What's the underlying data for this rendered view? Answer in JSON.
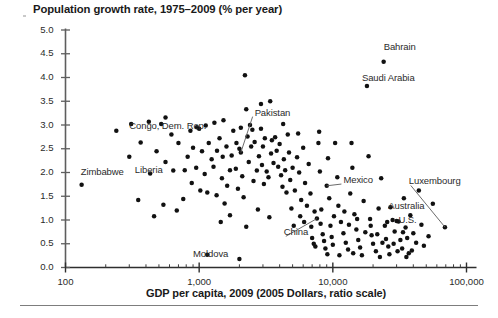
{
  "chart_data": {
    "type": "scatter",
    "title": "Population growth rate, 1975–2009 (% per year)",
    "xlabel": "GDP per capita, 2009 (2005 Dollars, ratio scale)",
    "ylabel": "",
    "xscale": "log",
    "yscale": "linear",
    "xlim": [
      100,
      100000
    ],
    "ylim": [
      0.0,
      5.0
    ],
    "grid": false,
    "legend": "none",
    "xtick_labels": [
      "100",
      "1,000",
      "10,000",
      "100,000"
    ],
    "xtick_values": [
      100,
      1000,
      10000,
      100000
    ],
    "ytick_labels": [
      "0.0",
      "0.5",
      "1.0",
      "1.5",
      "2.0",
      "2.5",
      "3.0",
      "3.5",
      "4.0",
      "4.5",
      "5.0"
    ],
    "ytick_values": [
      0.0,
      0.5,
      1.0,
      1.5,
      2.0,
      2.5,
      3.0,
      3.5,
      4.0,
      4.5,
      5.0
    ],
    "annotations": [
      {
        "text": "Congo, Dem. Rep.",
        "x": 300,
        "y": 2.95,
        "align": "left",
        "leader": false
      },
      {
        "text": "Liberia",
        "x": 330,
        "y": 2.03,
        "align": "left",
        "leader": false
      },
      {
        "text": "Zimbabwe",
        "x": 130,
        "y": 2.0,
        "align": "left",
        "leader": false
      },
      {
        "text": "Pakistan",
        "x": 2600,
        "y": 3.24,
        "align": "left",
        "leader": true,
        "leader_to_x": 2050,
        "leader_to_y": 2.42
      },
      {
        "text": "Bahrain",
        "x": 24000,
        "y": 4.63,
        "align": "left",
        "leader": false
      },
      {
        "text": "Saudi Arabia",
        "x": 16500,
        "y": 3.96,
        "align": "left",
        "leader": false
      },
      {
        "text": "Mexico",
        "x": 12000,
        "y": 1.82,
        "align": "left",
        "leader": true,
        "leader_to_x": 9000,
        "leader_to_y": 1.72
      },
      {
        "text": "Luxembourg",
        "x": 37000,
        "y": 1.79,
        "align": "left",
        "leader": true,
        "leader_to_x": 69000,
        "leader_to_y": 0.85
      },
      {
        "text": "Australia",
        "x": 26000,
        "y": 1.27,
        "align": "left",
        "leader": false
      },
      {
        "text": "U.S.",
        "x": 31000,
        "y": 0.97,
        "align": "left",
        "leader": false
      },
      {
        "text": "China",
        "x": 4300,
        "y": 0.72,
        "align": "left",
        "leader": true,
        "leader_to_x": 7600,
        "leader_to_y": 1.03
      },
      {
        "text": "Moldova",
        "x": 900,
        "y": 0.27,
        "align": "left",
        "leader": false
      }
    ],
    "points": [
      {
        "x": 132,
        "y": 1.74
      },
      {
        "x": 310,
        "y": 3.02
      },
      {
        "x": 240,
        "y": 2.88
      },
      {
        "x": 420,
        "y": 3.07
      },
      {
        "x": 520,
        "y": 3.02
      },
      {
        "x": 365,
        "y": 2.63
      },
      {
        "x": 300,
        "y": 2.33
      },
      {
        "x": 480,
        "y": 2.45
      },
      {
        "x": 620,
        "y": 2.8
      },
      {
        "x": 700,
        "y": 2.62
      },
      {
        "x": 560,
        "y": 2.22
      },
      {
        "x": 640,
        "y": 2.04
      },
      {
        "x": 430,
        "y": 1.98
      },
      {
        "x": 780,
        "y": 2.05
      },
      {
        "x": 350,
        "y": 1.42
      },
      {
        "x": 540,
        "y": 1.32
      },
      {
        "x": 860,
        "y": 2.88
      },
      {
        "x": 960,
        "y": 2.95
      },
      {
        "x": 1000,
        "y": 2.92
      },
      {
        "x": 1120,
        "y": 2.99
      },
      {
        "x": 900,
        "y": 2.52
      },
      {
        "x": 1050,
        "y": 2.45
      },
      {
        "x": 820,
        "y": 2.33
      },
      {
        "x": 1180,
        "y": 2.62
      },
      {
        "x": 1240,
        "y": 2.28
      },
      {
        "x": 950,
        "y": 2.1
      },
      {
        "x": 1100,
        "y": 1.97
      },
      {
        "x": 880,
        "y": 1.78
      },
      {
        "x": 1020,
        "y": 1.62
      },
      {
        "x": 1150,
        "y": 1.58
      },
      {
        "x": 760,
        "y": 1.44
      },
      {
        "x": 1300,
        "y": 3.05
      },
      {
        "x": 1420,
        "y": 2.72
      },
      {
        "x": 1360,
        "y": 2.46
      },
      {
        "x": 1500,
        "y": 2.33
      },
      {
        "x": 1280,
        "y": 2.12
      },
      {
        "x": 1600,
        "y": 2.55
      },
      {
        "x": 1480,
        "y": 1.88
      },
      {
        "x": 1620,
        "y": 1.72
      },
      {
        "x": 1350,
        "y": 1.52
      },
      {
        "x": 1550,
        "y": 1.35
      },
      {
        "x": 1700,
        "y": 2.05
      },
      {
        "x": 1800,
        "y": 2.88
      },
      {
        "x": 1900,
        "y": 2.62
      },
      {
        "x": 1750,
        "y": 2.36
      },
      {
        "x": 2000,
        "y": 2.5
      },
      {
        "x": 2050,
        "y": 2.42
      },
      {
        "x": 1880,
        "y": 2.08
      },
      {
        "x": 2100,
        "y": 1.92
      },
      {
        "x": 2200,
        "y": 4.05
      },
      {
        "x": 2250,
        "y": 3.33
      },
      {
        "x": 1950,
        "y": 1.66
      },
      {
        "x": 2150,
        "y": 1.48
      },
      {
        "x": 2300,
        "y": 2.76
      },
      {
        "x": 2400,
        "y": 3.0
      },
      {
        "x": 2500,
        "y": 2.9
      },
      {
        "x": 2450,
        "y": 2.55
      },
      {
        "x": 2600,
        "y": 2.64
      },
      {
        "x": 2350,
        "y": 2.22
      },
      {
        "x": 2700,
        "y": 2.04
      },
      {
        "x": 2550,
        "y": 1.82
      },
      {
        "x": 2800,
        "y": 2.34
      },
      {
        "x": 2900,
        "y": 2.92
      },
      {
        "x": 3000,
        "y": 2.55
      },
      {
        "x": 3100,
        "y": 2.72
      },
      {
        "x": 2950,
        "y": 2.16
      },
      {
        "x": 3200,
        "y": 2.02
      },
      {
        "x": 3050,
        "y": 1.76
      },
      {
        "x": 3300,
        "y": 1.9
      },
      {
        "x": 3400,
        "y": 3.5
      },
      {
        "x": 3500,
        "y": 2.68
      },
      {
        "x": 3450,
        "y": 2.4
      },
      {
        "x": 3600,
        "y": 2.2
      },
      {
        "x": 3700,
        "y": 2.74
      },
      {
        "x": 3800,
        "y": 2.46
      },
      {
        "x": 3900,
        "y": 2.12
      },
      {
        "x": 4000,
        "y": 2.6
      },
      {
        "x": 4100,
        "y": 1.94
      },
      {
        "x": 4200,
        "y": 1.7
      },
      {
        "x": 4300,
        "y": 2.28
      },
      {
        "x": 4400,
        "y": 2.05
      },
      {
        "x": 4500,
        "y": 1.58
      },
      {
        "x": 4600,
        "y": 2.8
      },
      {
        "x": 4700,
        "y": 2.42
      },
      {
        "x": 4800,
        "y": 1.84
      },
      {
        "x": 5000,
        "y": 2.1
      },
      {
        "x": 5200,
        "y": 1.62
      },
      {
        "x": 5400,
        "y": 2.32
      },
      {
        "x": 5600,
        "y": 2.0
      },
      {
        "x": 5800,
        "y": 1.42
      },
      {
        "x": 6000,
        "y": 2.52
      },
      {
        "x": 6200,
        "y": 1.78
      },
      {
        "x": 6400,
        "y": 1.3
      },
      {
        "x": 6600,
        "y": 2.18
      },
      {
        "x": 6800,
        "y": 1.56
      },
      {
        "x": 7000,
        "y": 0.62
      },
      {
        "x": 7200,
        "y": 0.5
      },
      {
        "x": 7400,
        "y": 0.44
      },
      {
        "x": 7600,
        "y": 1.03
      },
      {
        "x": 7800,
        "y": 2.62
      },
      {
        "x": 8000,
        "y": 2.02
      },
      {
        "x": 8200,
        "y": 1.22
      },
      {
        "x": 8400,
        "y": 0.7
      },
      {
        "x": 8600,
        "y": 0.56
      },
      {
        "x": 8800,
        "y": 0.4
      },
      {
        "x": 9000,
        "y": 1.72
      },
      {
        "x": 9200,
        "y": 2.3
      },
      {
        "x": 9400,
        "y": 1.46
      },
      {
        "x": 9600,
        "y": 0.88
      },
      {
        "x": 9800,
        "y": 0.64
      },
      {
        "x": 10000,
        "y": 0.48
      },
      {
        "x": 10400,
        "y": 2.62
      },
      {
        "x": 10800,
        "y": 1.9
      },
      {
        "x": 11000,
        "y": 1.3
      },
      {
        "x": 11500,
        "y": 0.96
      },
      {
        "x": 12000,
        "y": 0.72
      },
      {
        "x": 12500,
        "y": 0.52
      },
      {
        "x": 13000,
        "y": 0.38
      },
      {
        "x": 13500,
        "y": 1.56
      },
      {
        "x": 14000,
        "y": 2.1
      },
      {
        "x": 14500,
        "y": 1.12
      },
      {
        "x": 15000,
        "y": 0.8
      },
      {
        "x": 15500,
        "y": 0.58
      },
      {
        "x": 16000,
        "y": 0.42
      },
      {
        "x": 17000,
        "y": 1.4
      },
      {
        "x": 18000,
        "y": 3.82
      },
      {
        "x": 18500,
        "y": 2.34
      },
      {
        "x": 19000,
        "y": 1.02
      },
      {
        "x": 19500,
        "y": 0.68
      },
      {
        "x": 20000,
        "y": 0.5
      },
      {
        "x": 21000,
        "y": 0.34
      },
      {
        "x": 22000,
        "y": 1.24
      },
      {
        "x": 23000,
        "y": 1.88
      },
      {
        "x": 24000,
        "y": 4.33
      },
      {
        "x": 24500,
        "y": 0.88
      },
      {
        "x": 25000,
        "y": 0.6
      },
      {
        "x": 26000,
        "y": 0.44
      },
      {
        "x": 27000,
        "y": 1.27
      },
      {
        "x": 28000,
        "y": 1.0
      },
      {
        "x": 29000,
        "y": 0.76
      },
      {
        "x": 30000,
        "y": 0.98
      },
      {
        "x": 31000,
        "y": 0.97
      },
      {
        "x": 32000,
        "y": 0.58
      },
      {
        "x": 33000,
        "y": 0.4
      },
      {
        "x": 34000,
        "y": 1.46
      },
      {
        "x": 35000,
        "y": 0.84
      },
      {
        "x": 36000,
        "y": 0.62
      },
      {
        "x": 37000,
        "y": 0.3
      },
      {
        "x": 38000,
        "y": 1.1
      },
      {
        "x": 40000,
        "y": 0.72
      },
      {
        "x": 42000,
        "y": 0.52
      },
      {
        "x": 44000,
        "y": 1.62
      },
      {
        "x": 46000,
        "y": 0.9
      },
      {
        "x": 48000,
        "y": 0.46
      },
      {
        "x": 52000,
        "y": 0.66
      },
      {
        "x": 56000,
        "y": 1.34
      },
      {
        "x": 69000,
        "y": 0.85
      },
      {
        "x": 2000,
        "y": 0.18
      },
      {
        "x": 1150,
        "y": 0.27
      },
      {
        "x": 6900,
        "y": 0.86
      },
      {
        "x": 7300,
        "y": 1.18
      },
      {
        "x": 5100,
        "y": 0.88
      },
      {
        "x": 4900,
        "y": 1.24
      },
      {
        "x": 8100,
        "y": 0.92
      },
      {
        "x": 10200,
        "y": 1.08
      },
      {
        "x": 12200,
        "y": 1.18
      },
      {
        "x": 13200,
        "y": 0.9
      },
      {
        "x": 15200,
        "y": 1.02
      },
      {
        "x": 17500,
        "y": 0.74
      },
      {
        "x": 19200,
        "y": 0.88
      },
      {
        "x": 21500,
        "y": 0.7
      },
      {
        "x": 23500,
        "y": 0.52
      },
      {
        "x": 25500,
        "y": 0.96
      },
      {
        "x": 28500,
        "y": 0.5
      },
      {
        "x": 30500,
        "y": 0.34
      },
      {
        "x": 33500,
        "y": 0.74
      },
      {
        "x": 39000,
        "y": 0.36
      },
      {
        "x": 1450,
        "y": 0.96
      },
      {
        "x": 2750,
        "y": 1.22
      },
      {
        "x": 3350,
        "y": 1.06
      },
      {
        "x": 5700,
        "y": 1.08
      },
      {
        "x": 6100,
        "y": 0.96
      },
      {
        "x": 460,
        "y": 1.08
      },
      {
        "x": 680,
        "y": 1.2
      },
      {
        "x": 1700,
        "y": 1.1
      },
      {
        "x": 2250,
        "y": 0.86
      },
      {
        "x": 9100,
        "y": 0.28
      },
      {
        "x": 11200,
        "y": 0.26
      },
      {
        "x": 14200,
        "y": 0.3
      },
      {
        "x": 16500,
        "y": 0.26
      },
      {
        "x": 22500,
        "y": 0.22
      },
      {
        "x": 26500,
        "y": 0.28
      },
      {
        "x": 35500,
        "y": 0.22
      },
      {
        "x": 2900,
        "y": 3.44
      },
      {
        "x": 1520,
        "y": 3.1
      },
      {
        "x": 560,
        "y": 3.16
      },
      {
        "x": 4250,
        "y": 3.02
      },
      {
        "x": 5500,
        "y": 2.82
      },
      {
        "x": 7900,
        "y": 2.86
      },
      {
        "x": 13800,
        "y": 2.62
      },
      {
        "x": 2050,
        "y": 2.94
      }
    ]
  }
}
